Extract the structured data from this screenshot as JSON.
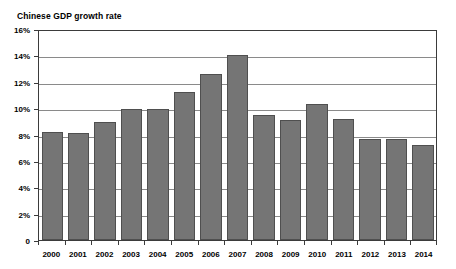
{
  "chart_data": {
    "type": "bar",
    "title": "Chinese GDP growth rate",
    "xlabel": "",
    "ylabel": "",
    "categories": [
      "2000",
      "2001",
      "2002",
      "2003",
      "2004",
      "2005",
      "2006",
      "2007",
      "2008",
      "2009",
      "2010",
      "2011",
      "2012",
      "2013",
      "2014"
    ],
    "values": [
      8.3,
      8.2,
      9.0,
      10.0,
      10.0,
      11.3,
      12.7,
      14.2,
      9.6,
      9.2,
      10.4,
      9.3,
      7.7,
      7.7,
      7.3
    ],
    "ylim": [
      0,
      16
    ],
    "y_tick_values": [
      0,
      2,
      4,
      6,
      8,
      10,
      12,
      14,
      16
    ],
    "y_tick_labels": [
      "0",
      "2%",
      "4%",
      "6%",
      "8%",
      "10%",
      "12%",
      "14%",
      "16%"
    ],
    "grid": true,
    "grid_axis": "y",
    "legend": false,
    "bar_color": "#757575",
    "bar_border_color": "#4f4f4f",
    "gridline_color": "#8a8a8a",
    "axis_color": "#3b3b3b",
    "background_color": "#ffffff",
    "text_color": "#000000"
  }
}
